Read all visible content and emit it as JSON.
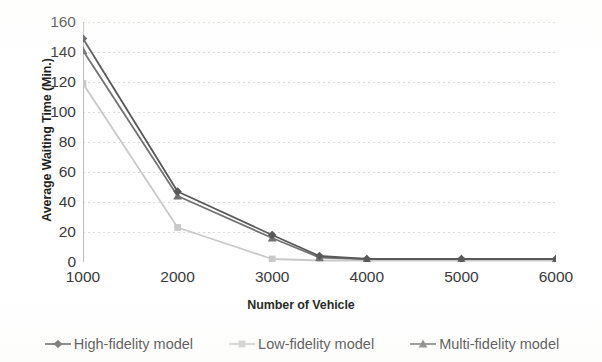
{
  "chart_data": {
    "type": "line",
    "title": "",
    "xlabel": "Number of Vehicle",
    "ylabel": "Average Waiting Time (Min.)",
    "x": [
      1000,
      2000,
      3000,
      3500,
      4000,
      5000,
      6000
    ],
    "xlim": [
      1000,
      6000
    ],
    "ylim": [
      0,
      160
    ],
    "xticks": [
      "1000",
      "2000",
      "3000",
      "4000",
      "5000",
      "6000"
    ],
    "xtick_values": [
      1000,
      2000,
      3000,
      4000,
      5000,
      6000
    ],
    "yticks": [
      "0",
      "20",
      "40",
      "60",
      "80",
      "100",
      "120",
      "140",
      "160"
    ],
    "ytick_values": [
      0,
      20,
      40,
      60,
      80,
      100,
      120,
      140,
      160
    ],
    "grid": "horizontal-dotted",
    "legend_position": "bottom",
    "series": [
      {
        "name": "High-fidelity model",
        "marker": "diamond",
        "color": "#595959",
        "values": [
          149,
          47,
          18,
          4,
          2,
          2,
          2
        ]
      },
      {
        "name": "Low-fidelity model",
        "marker": "square",
        "color": "#c9c9c9",
        "values": [
          119,
          23,
          2,
          1,
          1,
          1,
          1
        ]
      },
      {
        "name": "Multi-fidelity model",
        "marker": "triangle",
        "color": "#737373",
        "values": [
          141,
          44,
          16,
          3,
          2,
          2,
          2
        ]
      }
    ]
  },
  "axis": {
    "y_title": "Average Waiting Time (Min.)",
    "x_title": "Number of Vehicle",
    "y_tick_labels": [
      "160",
      "140",
      "120",
      "100",
      "80",
      "60",
      "40",
      "20",
      "0"
    ],
    "x_tick_labels": [
      "1000",
      "2000",
      "3000",
      "4000",
      "5000",
      "6000"
    ]
  },
  "legend": {
    "items": [
      {
        "label": "High-fidelity model",
        "marker": "diamond",
        "color": "#595959"
      },
      {
        "label": "Low-fidelity model",
        "marker": "square",
        "color": "#c9c9c9"
      },
      {
        "label": "Multi-fidelity model",
        "marker": "triangle",
        "color": "#737373"
      }
    ]
  },
  "colors": {
    "axis_line": "#bfbfbf",
    "gridline": "#dcdcdc",
    "text": "#3b3b3b",
    "title_text": "#231f20",
    "background": "#ffffff"
  }
}
